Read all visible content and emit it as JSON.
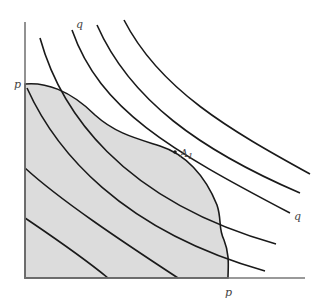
{
  "diagram": {
    "type": "production-possibility frontier with indifference curves",
    "colors": {
      "region_fill": "#dcdcdc",
      "curve_stroke": "#1a1a1a",
      "axis_stroke": "#777777",
      "label_color": "#444444"
    },
    "labels": {
      "y_axis_intercept": "p",
      "x_axis_intercept": "p",
      "curve_top": "q",
      "curve_right": "q",
      "tangency_point": "A",
      "tangency_subscript": "1"
    },
    "curves": [
      {
        "id": "c1",
        "path": "M27 88 C 55 150, 120 230, 265 271"
      },
      {
        "id": "c2",
        "path": "M40 38 C 60 110, 120 200, 276 244"
      },
      {
        "id": "c3",
        "path": "M72 30 C 100 110, 170 150, 290 213"
      },
      {
        "id": "c4",
        "path": "M97 25 C 130 100, 200 150, 300 193"
      },
      {
        "id": "c5",
        "path": "M124 20 C 160 90, 230 130, 310 174"
      },
      {
        "id": "c6",
        "path": "M25 168 C 60 200, 120 240, 178 278"
      },
      {
        "id": "c7",
        "path": "M25 218 C 50 235, 80 255, 108 278"
      }
    ]
  }
}
